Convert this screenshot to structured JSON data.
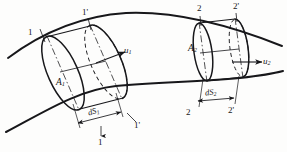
{
  "figure": {
    "kind": "stream-tube-continuity-diagram",
    "title": "",
    "background_color": "#fdfdfc",
    "ink_color": "#17171a",
    "width": 287,
    "height": 152
  },
  "labels": {
    "station_1_upper": "1",
    "station_1_prime_upper": "1'",
    "station_1_lower": "1",
    "station_1_prime_lower": "1'",
    "station_2_upper": "2",
    "station_2_prime_upper": "2'",
    "station_2_lower": "2",
    "station_2_prime_lower": "2'",
    "area_1": "A",
    "area_1_sub": "1",
    "area_2": "A",
    "area_2_sub": "2",
    "velocity_1": "u",
    "velocity_1_sub": "1",
    "velocity_2": "u",
    "velocity_2_sub": "2",
    "length_1": "dS",
    "length_1_sub": "1",
    "length_2": "dS",
    "length_2_sub": "2"
  },
  "geometry": {
    "upper_streamline": "M 8,58 C 40,34 80,16 126,13 C 172,11 222,22 282,46",
    "lower_streamline": "M 6,132 C 44,112 78,90 116,86 C 158,82 196,82 240,78 C 258,76 272,74 283,71",
    "tube_1": {
      "front_ellipse_cx": 63,
      "front_ellipse_cy": 73,
      "front_rx": 15,
      "front_ry": 40,
      "front_rotation": -24,
      "back_ellipse_cx": 106,
      "back_ellipse_cy": 62,
      "back_rx": 15,
      "back_ry": 40,
      "back_rotation": -24
    },
    "tube_2": {
      "front_ellipse_cx": 203,
      "front_ellipse_cy": 52,
      "front_rx": 9,
      "front_ry": 29,
      "front_rotation": -8,
      "back_ellipse_cx": 239,
      "back_ellipse_cy": 48,
      "back_rx": 9,
      "back_ry": 29,
      "back_rotation": -8
    },
    "arrow_u1": {
      "x1": 88,
      "y1": 65,
      "x2": 122,
      "y2": 52
    },
    "arrow_u2": {
      "x1": 221,
      "y1": 62,
      "x2": 258,
      "y2": 62
    },
    "dim_ds1": {
      "x1": 79,
      "y1": 122,
      "x2": 120,
      "y2": 110
    },
    "dim_ds2": {
      "x1": 195,
      "y1": 103,
      "x2": 232,
      "y2": 100
    }
  }
}
